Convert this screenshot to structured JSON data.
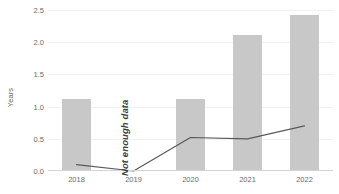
{
  "chart_data": {
    "type": "bar",
    "title": "",
    "subtitle": "",
    "xlabel": "",
    "ylabel": "Years",
    "categories": [
      "2018",
      "2019",
      "2020",
      "2021",
      "2022"
    ],
    "ylim": [
      0.0,
      2.5
    ],
    "y_ticks": [
      "0.0",
      "0.5",
      "1.0",
      "1.5",
      "2.0",
      "2.5"
    ],
    "y_tick_values": [
      0.0,
      0.5,
      1.0,
      1.5,
      2.0,
      2.5
    ],
    "grid": "horizontal",
    "legend": "none",
    "series": [
      {
        "name": "bars",
        "type": "bar",
        "color": "#c8c8c8",
        "values": [
          1.1,
          null,
          1.1,
          2.1,
          2.4
        ]
      },
      {
        "name": "line",
        "type": "line",
        "color": "#595959",
        "values": [
          0.1,
          0.0,
          0.52,
          0.5,
          0.7
        ]
      }
    ],
    "annotations": [
      {
        "text": "Not enough data",
        "category": "2019",
        "rotation": -90,
        "style": "bold-italic",
        "color": "#3d3d3d"
      }
    ]
  },
  "colors": {
    "background": "#ffffff",
    "bar": "#c8c8c8",
    "line": "#595959",
    "gridline": "#eff1f3",
    "axis": "#d2d4d6",
    "tick_text": "#6b6b6b",
    "annotation_text": "#3d3d3d"
  }
}
